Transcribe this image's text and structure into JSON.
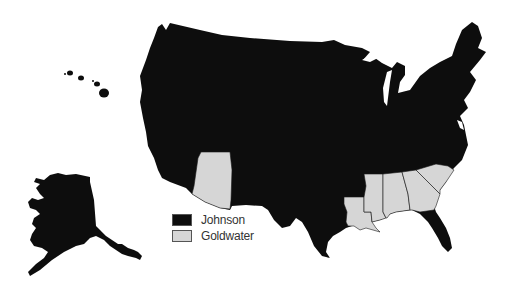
{
  "map": {
    "title": "",
    "subject": "1964 United States presidential election results by state",
    "legend": [
      {
        "label": "Johnson",
        "color": "#0d0d0d"
      },
      {
        "label": "Goldwater",
        "color": "#d6d6d6"
      }
    ],
    "goldwater_states": [
      "Arizona",
      "Louisiana",
      "Mississippi",
      "Alabama",
      "Georgia",
      "South Carolina"
    ],
    "johnson_states_note": "All other states including Alaska and Hawaii",
    "insets": [
      "Alaska",
      "Hawaii"
    ]
  }
}
